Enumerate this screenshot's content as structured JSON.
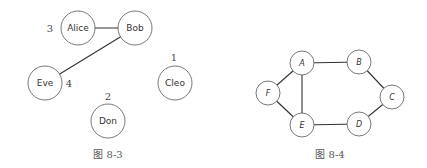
{
  "figures": [
    {
      "caption": "图 8-3",
      "caption_pos": [
        108,
        158
      ],
      "node_radius": 17,
      "nodes": [
        {
          "id": "Alice",
          "label": "Alice",
          "x": 78,
          "y": 28
        },
        {
          "id": "Bob",
          "label": "Bob",
          "x": 135,
          "y": 28
        },
        {
          "id": "Eve",
          "label": "Eve",
          "x": 45,
          "y": 83
        },
        {
          "id": "Cleo",
          "label": "Cleo",
          "x": 175,
          "y": 83
        },
        {
          "id": "Don",
          "label": "Don",
          "x": 108,
          "y": 121
        }
      ],
      "edges": [
        {
          "from": "Alice",
          "to": "Bob"
        },
        {
          "from": "Bob",
          "to": "Eve"
        }
      ],
      "annotations": [
        {
          "text": "3",
          "x": 50,
          "y": 32,
          "near": "Alice"
        },
        {
          "text": "1",
          "x": 174,
          "y": 61,
          "near": "Cleo"
        },
        {
          "text": "4",
          "x": 69,
          "y": 87,
          "near": "Eve"
        },
        {
          "text": "2",
          "x": 108,
          "y": 100,
          "near": "Don"
        }
      ]
    },
    {
      "caption": "图 8-4",
      "caption_pos": [
        330,
        158
      ],
      "node_radius": 12,
      "nodes": [
        {
          "id": "A",
          "label": "A",
          "x": 302,
          "y": 63
        },
        {
          "id": "B",
          "label": "B",
          "x": 359,
          "y": 62
        },
        {
          "id": "C",
          "label": "C",
          "x": 392,
          "y": 97
        },
        {
          "id": "D",
          "label": "D",
          "x": 359,
          "y": 124
        },
        {
          "id": "E",
          "label": "E",
          "x": 302,
          "y": 125
        },
        {
          "id": "F",
          "label": "F",
          "x": 268,
          "y": 93
        }
      ],
      "edges": [
        {
          "from": "A",
          "to": "B"
        },
        {
          "from": "B",
          "to": "C"
        },
        {
          "from": "C",
          "to": "D"
        },
        {
          "from": "D",
          "to": "E"
        },
        {
          "from": "E",
          "to": "F"
        },
        {
          "from": "F",
          "to": "A"
        },
        {
          "from": "A",
          "to": "E"
        }
      ]
    }
  ]
}
